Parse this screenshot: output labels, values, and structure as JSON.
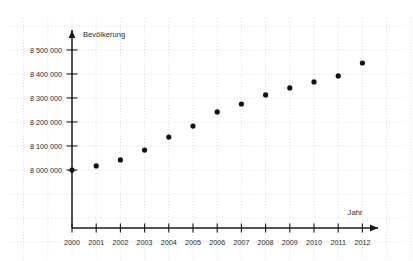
{
  "chart_data": {
    "type": "scatter",
    "title": "",
    "xlabel": "Jahr",
    "ylabel": "Bevölkerung",
    "grid": true,
    "legend": "none",
    "xlim": [
      2000,
      2012
    ],
    "ylim": [
      8000000,
      8500000
    ],
    "x": [
      2000,
      2001,
      2002,
      2003,
      2004,
      2005,
      2006,
      2007,
      2008,
      2009,
      2010,
      2011,
      2012
    ],
    "values": [
      8000000,
      8017000,
      8042000,
      8083000,
      8137000,
      8183000,
      8242000,
      8275000,
      8313000,
      8342000,
      8367000,
      8392000,
      8446000
    ],
    "xtick_labels": [
      "2000",
      "2001",
      "2002",
      "2003",
      "2004",
      "2005",
      "2006",
      "2007",
      "2008",
      "2009",
      "2010",
      "2011",
      "2012"
    ],
    "ytick_values": [
      8000000,
      8100000,
      8200000,
      8300000,
      8400000,
      8500000
    ],
    "ytick_labels": [
      "8 000 000",
      "8 100 000",
      "8 200 000",
      "8 300 000",
      "8 400 000",
      "8 500 000"
    ],
    "marker": "filled-circle",
    "marker_color": "#111111",
    "grid_color": "#c9c9c9",
    "axis_color": "#1a1a1a",
    "background_color": "#ffffff"
  }
}
